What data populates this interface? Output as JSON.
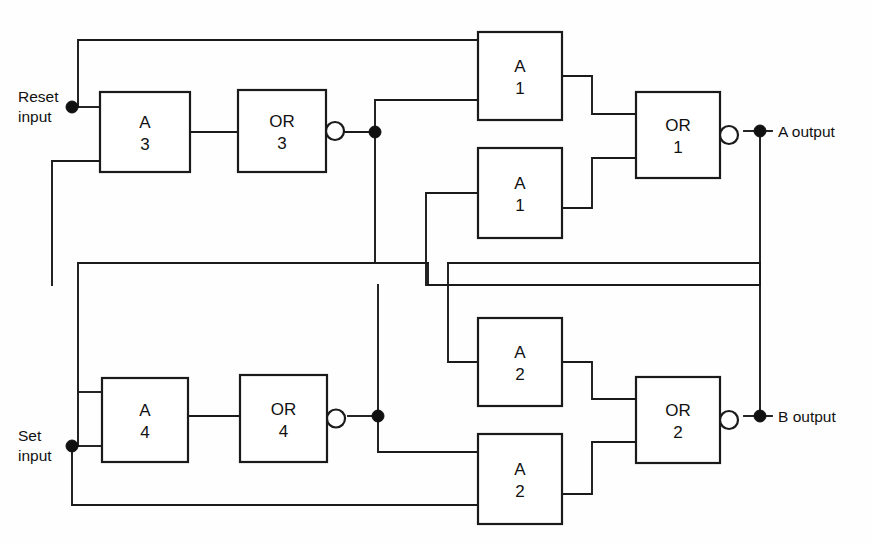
{
  "figure": {
    "kind": "logic-block-diagram",
    "title": "",
    "background_color": "#fefefe",
    "line_color": "#1a1a1a",
    "text_color": "#111111"
  },
  "io": {
    "reset": {
      "line1": "Reset",
      "line2": "input"
    },
    "set": {
      "line1": "Set",
      "line2": "input"
    },
    "a_output": "A output",
    "b_output": "B output"
  },
  "gates": [
    {
      "id": "A3",
      "line1": "A",
      "line2": "3",
      "x": 100,
      "y": 92,
      "w": 90,
      "h": 80,
      "inverted": false
    },
    {
      "id": "OR3",
      "line1": "OR",
      "line2": "3",
      "x": 238,
      "y": 90,
      "w": 88,
      "h": 82,
      "inverted": true
    },
    {
      "id": "A1a",
      "line1": "A",
      "line2": "1",
      "x": 478,
      "y": 32,
      "w": 84,
      "h": 88,
      "inverted": false
    },
    {
      "id": "A1b",
      "line1": "A",
      "line2": "1",
      "x": 478,
      "y": 148,
      "w": 84,
      "h": 90,
      "inverted": false
    },
    {
      "id": "OR1",
      "line1": "OR",
      "line2": "1",
      "x": 636,
      "y": 92,
      "w": 84,
      "h": 86,
      "inverted": true
    },
    {
      "id": "A4",
      "line1": "A",
      "line2": "4",
      "x": 102,
      "y": 378,
      "w": 86,
      "h": 84,
      "inverted": false
    },
    {
      "id": "OR4",
      "line1": "OR",
      "line2": "4",
      "x": 240,
      "y": 375,
      "w": 87,
      "h": 87,
      "inverted": true
    },
    {
      "id": "A2a",
      "line1": "A",
      "line2": "2",
      "x": 478,
      "y": 318,
      "w": 84,
      "h": 88,
      "inverted": false
    },
    {
      "id": "A2b",
      "line1": "A",
      "line2": "2",
      "x": 478,
      "y": 434,
      "w": 84,
      "h": 90,
      "inverted": false
    },
    {
      "id": "OR2",
      "line1": "OR",
      "line2": "2",
      "x": 636,
      "y": 377,
      "w": 84,
      "h": 86,
      "inverted": true
    }
  ],
  "junction_dots": [
    {
      "name": "reset-input-node",
      "x": 72,
      "y": 107
    },
    {
      "name": "or3-output-node",
      "x": 375,
      "y": 132
    },
    {
      "name": "a-output-node",
      "x": 760,
      "y": 131
    },
    {
      "name": "set-input-node",
      "x": 72,
      "y": 446
    },
    {
      "name": "or4-output-node",
      "x": 378,
      "y": 416
    },
    {
      "name": "b-output-node",
      "x": 760,
      "y": 416
    }
  ],
  "wires": [
    {
      "name": "reset-to-a3-in1",
      "d": "M 72 107 L 100 107"
    },
    {
      "name": "reset-up-to-top-bus",
      "d": "M 78 107 L 78 40 L 478 40 L 478 50"
    },
    {
      "name": "a3-lower-in-from-bus",
      "d": "M 100 161 L 52 161 L 52 285"
    },
    {
      "name": "a3-to-or3",
      "d": "M 190 132 L 238 132"
    },
    {
      "name": "or3-bubble-to-node",
      "d": "M 344 132 L 375 132"
    },
    {
      "name": "or3-node-up-to-a1a-in2",
      "d": "M 375 132 L 375 100 L 478 100"
    },
    {
      "name": "or3-node-down-to-bus",
      "d": "M 375 132 L 375 263 L 428 263 L 428 285"
    },
    {
      "name": "a1a-out-to-or1-in1",
      "d": "M 562 76 L 592 76 L 592 114 L 636 114"
    },
    {
      "name": "a1b-out-to-or1-in2",
      "d": "M 562 208 L 592 208 L 592 158 L 636 158"
    },
    {
      "name": "or1-bubble-to-aout",
      "d": "M 744 131 L 772 131"
    },
    {
      "name": "a-out-feedback-down",
      "d": "M 760 131 L 760 285 L 428 285"
    },
    {
      "name": "a1b-in-from-bus",
      "d": "M 478 193 L 426 193 L 426 285"
    },
    {
      "name": "bus-mid-upper-left",
      "d": "M 428 263 L 78 263 L 78 446"
    },
    {
      "name": "set-to-a4-in2",
      "d": "M 72 446 L 102 446"
    },
    {
      "name": "a4-in1-from-left",
      "d": "M 102 392 L 78 392"
    },
    {
      "name": "a4-to-or4",
      "d": "M 188 416 L 240 416"
    },
    {
      "name": "or4-bubble-to-node",
      "d": "M 348 416 L 378 416"
    },
    {
      "name": "or4-node-up",
      "d": "M 378 416 L 378 285"
    },
    {
      "name": "or4-node-down-to-a2b",
      "d": "M 378 416 L 378 452 L 478 452"
    },
    {
      "name": "a2a-in-from-bus",
      "d": "M 478 362 L 448 362 L 448 263"
    },
    {
      "name": "set-bottom-bus",
      "d": "M 72 446 L 72 505 L 478 505"
    },
    {
      "name": "a2a-out-to-or2-in1",
      "d": "M 562 362 L 592 362 L 592 399 L 636 399"
    },
    {
      "name": "a2b-out-to-or2-in2",
      "d": "M 562 494 L 592 494 L 592 442 L 636 442"
    },
    {
      "name": "or2-bubble-to-bout",
      "d": "M 744 416 L 772 416"
    },
    {
      "name": "b-out-feedback-up",
      "d": "M 760 416 L 760 263 L 448 263"
    }
  ],
  "chart_data": {
    "type": "diagram",
    "nodes": [
      "A 3",
      "OR 3",
      "A 1",
      "A 1",
      "OR 1",
      "A 4",
      "OR 4",
      "A 2",
      "A 2",
      "OR 2"
    ],
    "inputs": [
      "Reset input",
      "Set input"
    ],
    "outputs": [
      "A output",
      "B output"
    ]
  }
}
